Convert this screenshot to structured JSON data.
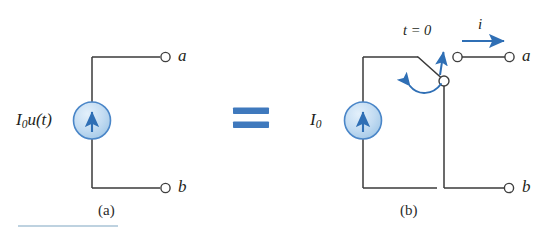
{
  "figure": {
    "type": "circuit-diagram",
    "background_color": "#ffffff",
    "wire_color": "#3a3a3a",
    "accent_color": "#2f6fb5",
    "source_fill_color": "#bcd9f0",
    "source_stroke_color": "#4a86c8",
    "equals_sign": {
      "symbol": "=",
      "color": "#3f79bd"
    },
    "rule_line": {
      "color": "#a9c3d6"
    }
  },
  "panel_a": {
    "caption": "(a)",
    "source_label_main": "I",
    "source_label_sub": "0",
    "source_label_func": "u(t)",
    "source_label_full": "I0u(t)",
    "terminal_top": "a",
    "terminal_bottom": "b",
    "source_symbol": "current-source-arrow-up"
  },
  "panel_b": {
    "caption": "(b)",
    "source_label_main": "I",
    "source_label_sub": "0",
    "source_label_full": "I0",
    "terminal_top": "a",
    "terminal_bottom": "b",
    "switch_label": "t = 0",
    "current_label": "i",
    "switch_symbol": "spst-switch-opening",
    "source_symbol": "current-source-arrow-up"
  }
}
